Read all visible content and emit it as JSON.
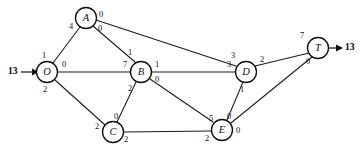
{
  "diagram": {
    "type": "directed-network-flow",
    "stroke_color": "#111111",
    "node_fill": "#ffffff",
    "background": "#ffffff",
    "source_supply": "13",
    "sink_demand": "13",
    "nodes": [
      {
        "id": "O",
        "label": "O",
        "cx": 47,
        "cy": 72,
        "r": 10.5
      },
      {
        "id": "A",
        "label": "A",
        "cx": 86,
        "cy": 18,
        "r": 10.5
      },
      {
        "id": "B",
        "label": "B",
        "cx": 141,
        "cy": 72,
        "r": 10.5
      },
      {
        "id": "C",
        "label": "C",
        "cx": 113,
        "cy": 132,
        "r": 10.5
      },
      {
        "id": "D",
        "label": "D",
        "cx": 246,
        "cy": 72,
        "r": 10.5
      },
      {
        "id": "E",
        "label": "E",
        "cx": 222,
        "cy": 130,
        "r": 10.5
      },
      {
        "id": "T",
        "label": "T",
        "cx": 318,
        "cy": 48,
        "r": 10.5
      }
    ],
    "edges": [
      {
        "id": "O-A",
        "from": "O",
        "to": "A",
        "from_label": "1",
        "to_label": "4",
        "from_label_x": 44,
        "from_label_y": 56,
        "to_label_x": 71,
        "to_label_y": 27
      },
      {
        "id": "O-B",
        "from": "O",
        "to": "B",
        "from_label": "0",
        "to_label": "7",
        "from_label_x": 64,
        "from_label_y": 65,
        "to_label_x": 125,
        "to_label_y": 65
      },
      {
        "id": "O-C",
        "from": "O",
        "to": "C",
        "from_label": "2",
        "to_label": "2",
        "from_label_x": 45,
        "from_label_y": 90,
        "to_label_x": 97,
        "to_label_y": 127
      },
      {
        "id": "A-B",
        "from": "A",
        "to": "B",
        "from_label": "0",
        "to_label": "1",
        "from_label_x": 100,
        "from_label_y": 29,
        "to_label_x": 130,
        "to_label_y": 53
      },
      {
        "id": "A-D",
        "from": "A",
        "to": "D",
        "from_label": "0",
        "to_label": "3",
        "from_label_x": 101,
        "from_label_y": 15,
        "to_label_x": 233,
        "to_label_y": 56
      },
      {
        "id": "B-C",
        "from": "B",
        "to": "C",
        "from_label": "2",
        "to_label": "0",
        "from_label_x": 130,
        "from_label_y": 89,
        "to_label_x": 116,
        "to_label_y": 117
      },
      {
        "id": "B-D",
        "from": "B",
        "to": "D",
        "from_label": "1",
        "to_label": "3",
        "from_label_x": 157,
        "from_label_y": 65,
        "to_label_x": 229,
        "to_label_y": 65
      },
      {
        "id": "B-E",
        "from": "B",
        "to": "E",
        "from_label": "0",
        "to_label": "5",
        "from_label_x": 157,
        "from_label_y": 80,
        "to_label_x": 211,
        "to_label_y": 119
      },
      {
        "id": "C-E",
        "from": "C",
        "to": "E",
        "from_label": "2",
        "to_label": "2",
        "from_label_x": 126,
        "from_label_y": 140,
        "to_label_x": 207,
        "to_label_y": 139
      },
      {
        "id": "D-E",
        "from": "D",
        "to": "E",
        "from_label": "1",
        "to_label": "0",
        "from_label_x": 242,
        "from_label_y": 90,
        "to_label_x": 229,
        "to_label_y": 117
      },
      {
        "id": "D-T",
        "from": "D",
        "to": "T",
        "from_label": "2",
        "to_label": "7",
        "from_label_x": 262,
        "from_label_y": 60,
        "to_label_x": 302,
        "to_label_y": 36
      },
      {
        "id": "E-T",
        "from": "E",
        "to": "T",
        "from_label": "0",
        "to_label": "0",
        "from_label_x": 238,
        "from_label_y": 131,
        "to_label_x": 308,
        "to_label_y": 62
      }
    ],
    "terminals": [
      {
        "id": "source-inflow",
        "value": "13",
        "label_x": 10,
        "label_y": 72
      },
      {
        "id": "sink-outflow",
        "value": "13",
        "label_x": 346,
        "label_y": 48
      }
    ]
  }
}
